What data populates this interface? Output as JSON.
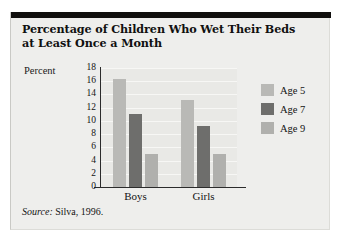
{
  "figure": {
    "title": "Percentage of Children Who Wet Their Beds at Least Once a Month",
    "title_line1": "Percentage of Children Who Wet Their Beds",
    "title_line2": "at Least Once a Month",
    "source_prefix": "Source:",
    "source_text": "Silva, 1996.",
    "colors": {
      "panel_background": "#eeeeec",
      "plot_background": "#e9e9e6",
      "rule": "#100f0d",
      "age5": "#b9b9b6",
      "age7": "#6e6e6c",
      "age9": "#b0b0ad",
      "axis": "#2b2b2b",
      "gridline": "#f7f7f5"
    }
  },
  "chart_data": {
    "type": "bar",
    "title": "Percentage of Children Who Wet Their Beds at Least Once a Month",
    "xlabel": "",
    "ylabel": "Percent",
    "categories": [
      "Boys",
      "Girls"
    ],
    "series": [
      {
        "name": "Age 5",
        "values": [
          16.3,
          13.1
        ],
        "color": "#b9b9b6"
      },
      {
        "name": "Age 7",
        "values": [
          11.1,
          9.2
        ],
        "color": "#6e6e6c"
      },
      {
        "name": "Age 9",
        "values": [
          5.0,
          5.0
        ],
        "color": "#b0b0ad"
      }
    ],
    "ylim": [
      0,
      18
    ],
    "yticks": [
      18,
      16,
      14,
      12,
      10,
      8,
      6,
      4,
      2,
      0
    ],
    "grid": true,
    "legend_position": "right"
  }
}
